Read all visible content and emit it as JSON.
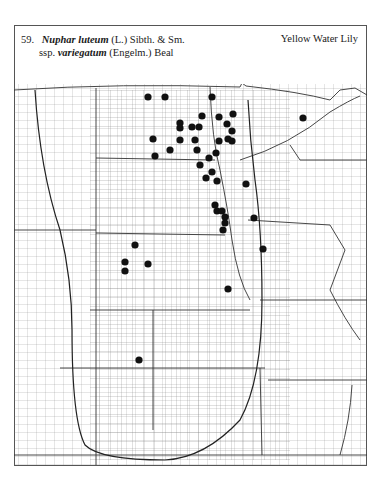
{
  "plate": {
    "number": "59.",
    "genus_species": "Nuphar luteum",
    "authority": "(L.) Sibth. & Sm.",
    "rank": "ssp.",
    "subspecies": "variegatum",
    "subspecies_authority": "(Engelm.) Beal",
    "common_name": "Yellow Water Lily"
  },
  "map": {
    "region": "Great Plains county map",
    "marker_color": "#111111",
    "line_color": "#444444",
    "occurrence_points": [
      [
        148,
        97
      ],
      [
        165,
        97
      ],
      [
        212,
        97
      ],
      [
        303,
        118
      ],
      [
        202,
        116
      ],
      [
        219,
        117
      ],
      [
        233,
        114
      ],
      [
        180,
        123
      ],
      [
        180,
        128
      ],
      [
        192,
        127
      ],
      [
        199,
        127
      ],
      [
        227,
        124
      ],
      [
        232,
        131
      ],
      [
        228,
        139
      ],
      [
        153,
        139
      ],
      [
        180,
        140
      ],
      [
        195,
        140
      ],
      [
        219,
        141
      ],
      [
        232,
        141
      ],
      [
        170,
        150
      ],
      [
        197,
        150
      ],
      [
        216,
        153
      ],
      [
        155,
        156
      ],
      [
        209,
        158
      ],
      [
        246,
        184
      ],
      [
        200,
        165
      ],
      [
        212,
        172
      ],
      [
        206,
        178
      ],
      [
        217,
        181
      ],
      [
        215,
        205
      ],
      [
        217,
        211
      ],
      [
        222,
        211
      ],
      [
        225,
        217
      ],
      [
        225,
        223
      ],
      [
        223,
        230
      ],
      [
        254,
        218
      ],
      [
        135,
        245
      ],
      [
        125,
        262
      ],
      [
        148,
        264
      ],
      [
        125,
        271
      ],
      [
        263,
        249
      ],
      [
        228,
        289
      ],
      [
        139,
        360
      ]
    ]
  }
}
